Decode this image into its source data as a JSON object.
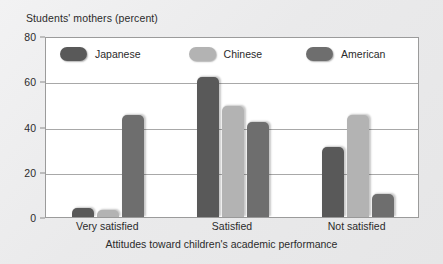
{
  "chart_data": {
    "type": "bar",
    "title": "",
    "ylabel": "Students' mothers (percent)",
    "xlabel": "Attitudes toward children's academic performance",
    "categories": [
      "Very satisfied",
      "Satisfied",
      "Not satisfied"
    ],
    "series": [
      {
        "name": "Japanese",
        "color": "#595959",
        "values": [
          4,
          62,
          31
        ]
      },
      {
        "name": "Chinese",
        "color": "#b3b3b3",
        "values": [
          3,
          49,
          45
        ]
      },
      {
        "name": "American",
        "color": "#6e6e6e",
        "values": [
          45,
          42,
          10
        ]
      }
    ],
    "ylim": [
      0,
      80
    ],
    "yticks": [
      0,
      20,
      40,
      60,
      80
    ],
    "ytick_labels": [
      "0",
      "20",
      "40",
      "60",
      "80"
    ],
    "grid": true,
    "legend_position": "inside-top-left",
    "plot_background": "#ffffff",
    "figure_background": "#ececed",
    "axis_color": "#9b9b9b",
    "gridline_color": "#a8a8a8",
    "text_color": "#2b2b2b"
  }
}
